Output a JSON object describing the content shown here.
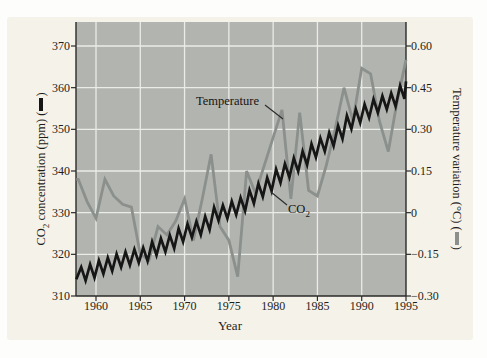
{
  "colors": {
    "co2_line": "#161616",
    "temperature_line": "#8b908d",
    "plot_background": "#b2b4b0",
    "gridline": "#eaece8",
    "panel_background": "#f5f3e9",
    "axis": "#2a2a2a",
    "text": "#1f1d1a"
  },
  "annotations": {
    "temperature": {
      "text": "Temperature"
    },
    "co2": {
      "prefix": "CO",
      "sub": "2"
    }
  },
  "chart_data": {
    "type": "line",
    "title": "",
    "grid": true,
    "plot_background": "gray",
    "axes": {
      "x": {
        "title": "Year",
        "tick_labels": [
          "1960",
          "1965",
          "1970",
          "1975",
          "1980",
          "1985",
          "1990",
          "1995"
        ],
        "tick_values": [
          1960,
          1965,
          1970,
          1975,
          1980,
          1985,
          1990,
          1995
        ],
        "range_years": [
          1957.8,
          1995.1
        ]
      },
      "y_left": {
        "title_prefix": "CO",
        "title_sub": "2",
        "title_suffix": " concentration (ppm) (",
        "title_close": ")",
        "tick_labels": [
          "370",
          "360",
          "350",
          "340",
          "330",
          "320",
          "310"
        ],
        "tick_values": [
          370,
          360,
          350,
          340,
          330,
          320,
          310
        ],
        "range": [
          310,
          370
        ]
      },
      "y_right": {
        "title_prefix": "Temperature variation (°C) (",
        "title_close": ")",
        "tick_labels": [
          "0.60",
          "0.45",
          "0.30",
          "0.15",
          "0",
          "−0.15",
          "−0.30"
        ],
        "tick_values": [
          0.6,
          0.45,
          0.3,
          0.15,
          0,
          -0.15,
          -0.3
        ],
        "range": [
          -0.3,
          0.6
        ]
      }
    },
    "x_years": [
      1958,
      1959,
      1960,
      1961,
      1962,
      1963,
      1964,
      1965,
      1966,
      1967,
      1968,
      1969,
      1970,
      1971,
      1972,
      1973,
      1974,
      1975,
      1976,
      1977,
      1978,
      1979,
      1980,
      1981,
      1982,
      1983,
      1984,
      1985,
      1986,
      1987,
      1988,
      1989,
      1990,
      1991,
      1992,
      1993,
      1994,
      1995
    ],
    "series": [
      {
        "name": "CO2 concentration",
        "axis": "left",
        "unit": "ppm",
        "color": "#161616",
        "style": "seasonal-zigzag",
        "seasonal_amplitude_ppm": 1.6,
        "annual_means": [
          315.3,
          316.0,
          316.9,
          317.6,
          318.5,
          319.0,
          319.6,
          320.0,
          321.4,
          322.2,
          323.0,
          324.6,
          325.7,
          326.3,
          327.5,
          329.7,
          330.2,
          331.1,
          332.0,
          333.8,
          335.4,
          336.8,
          338.8,
          340.1,
          341.5,
          343.1,
          344.9,
          346.3,
          347.6,
          349.3,
          351.7,
          353.2,
          354.4,
          355.6,
          356.4,
          357.1,
          358.9,
          360.9
        ]
      },
      {
        "name": "Temperature variation",
        "axis": "right",
        "unit": "°C",
        "color": "#8b908d",
        "values": [
          0.12,
          0.04,
          -0.02,
          0.12,
          0.06,
          0.03,
          0.02,
          -0.15,
          -0.17,
          -0.05,
          -0.08,
          -0.03,
          0.05,
          -0.1,
          0.05,
          0.21,
          -0.05,
          -0.1,
          -0.23,
          0.15,
          0.07,
          0.17,
          0.27,
          0.37,
          0.05,
          0.36,
          0.08,
          0.06,
          0.17,
          0.3,
          0.45,
          0.33,
          0.52,
          0.5,
          0.33,
          0.22,
          0.4,
          0.55
        ]
      }
    ]
  }
}
